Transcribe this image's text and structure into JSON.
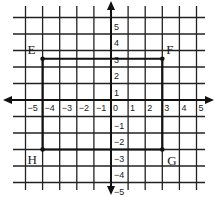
{
  "diagram": {
    "type": "coordinate-plane",
    "x_range": [
      -5,
      5
    ],
    "y_range": [
      -5,
      5
    ],
    "x_ticks": [
      "-5",
      "-4",
      "-3",
      "-2",
      "-1",
      "0",
      "1",
      "2",
      "3",
      "4",
      "5"
    ],
    "y_ticks": [
      "5",
      "4",
      "3",
      "2",
      "1",
      "-1",
      "-2",
      "-3",
      "-4",
      "-5"
    ],
    "points": [
      {
        "label": "E",
        "x": -4,
        "y": 2.5
      },
      {
        "label": "F",
        "x": 3,
        "y": 2.5
      },
      {
        "label": "G",
        "x": 3,
        "y": -3
      },
      {
        "label": "H",
        "x": -4,
        "y": -3
      }
    ],
    "rectangle": [
      "E",
      "F",
      "G",
      "H"
    ],
    "colors": {
      "grid": "#222222",
      "axis": "#111111",
      "rectangle": "#111111",
      "background": "#ffffff"
    }
  }
}
